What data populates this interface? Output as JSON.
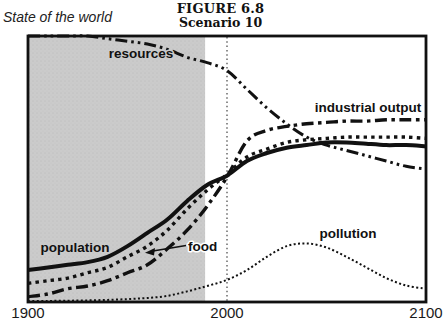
{
  "header": {
    "figure_title": "FIGURE 6.8",
    "figure_subtitle": "Scenario 10",
    "axis_context_label": "State of the world"
  },
  "x_axis": {
    "ticks": [
      "1900",
      "2000",
      "2100"
    ]
  },
  "colors": {
    "ink": "#111111",
    "shade": "#cbcbcb",
    "speckle": "#b9b9b9",
    "background": "#ffffff"
  },
  "chart_data": {
    "type": "line",
    "title": "FIGURE 6.8",
    "subtitle": "Scenario 10",
    "ylabel": "State of the world",
    "xlabel": "",
    "x_range": [
      1900,
      2100
    ],
    "y_range": [
      0,
      1
    ],
    "x_ticks": [
      1900,
      2000,
      2100
    ],
    "y_ticks": [],
    "grid": false,
    "legend": "inline-labels",
    "x": [
      1900,
      1910,
      1920,
      1930,
      1940,
      1950,
      1960,
      1970,
      1980,
      1990,
      2000,
      2010,
      2020,
      2030,
      2040,
      2050,
      2060,
      2070,
      2080,
      2090,
      2100
    ],
    "series": [
      {
        "name": "resources",
        "label": "resources",
        "style": "dash-dot-dot",
        "values": [
          1.0,
          1.0,
          1.0,
          1.0,
          0.99,
          0.98,
          0.97,
          0.95,
          0.92,
          0.9,
          0.87,
          0.8,
          0.73,
          0.67,
          0.62,
          0.59,
          0.57,
          0.55,
          0.53,
          0.51,
          0.5
        ]
      },
      {
        "name": "industrial_output",
        "label": "industrial output",
        "style": "dash-dot",
        "values": [
          0.02,
          0.03,
          0.05,
          0.06,
          0.08,
          0.11,
          0.14,
          0.2,
          0.27,
          0.36,
          0.47,
          0.605,
          0.645,
          0.66,
          0.67,
          0.675,
          0.68,
          0.68,
          0.685,
          0.685,
          0.685
        ]
      },
      {
        "name": "population",
        "label": "population",
        "style": "solid",
        "values": [
          0.12,
          0.13,
          0.14,
          0.15,
          0.17,
          0.21,
          0.26,
          0.31,
          0.38,
          0.44,
          0.475,
          0.53,
          0.56,
          0.58,
          0.59,
          0.6,
          0.6,
          0.595,
          0.59,
          0.59,
          0.585
        ]
      },
      {
        "name": "food",
        "label": "food",
        "style": "dotted",
        "values": [
          0.07,
          0.08,
          0.09,
          0.11,
          0.13,
          0.17,
          0.21,
          0.27,
          0.35,
          0.42,
          0.48,
          0.545,
          0.575,
          0.6,
          0.61,
          0.615,
          0.62,
          0.62,
          0.62,
          0.62,
          0.615
        ]
      },
      {
        "name": "pollution",
        "label": "pollution",
        "style": "fine-dotted",
        "values": [
          0.004,
          0.004,
          0.005,
          0.006,
          0.008,
          0.011,
          0.015,
          0.023,
          0.04,
          0.06,
          0.083,
          0.12,
          0.17,
          0.21,
          0.22,
          0.205,
          0.17,
          0.13,
          0.09,
          0.062,
          0.05
        ]
      }
    ],
    "annotations": {
      "shaded_region_years": [
        1900,
        1989
      ],
      "vertical_dotted_line_year": 2000,
      "food_callout_arrow": true
    }
  }
}
